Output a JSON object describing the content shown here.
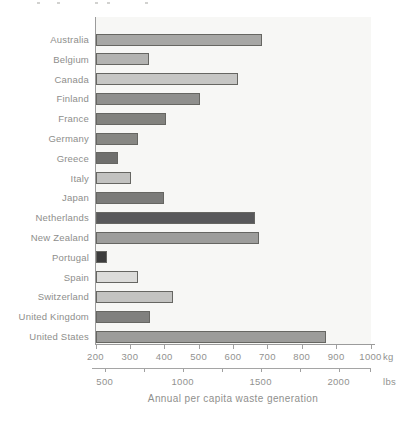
{
  "title": "Annual per capita waste generation",
  "colors": {
    "axis": "#9b9b9b",
    "tick": "#a0a0a0",
    "label_text": "#8e8e8c",
    "plot_background": "#f7f7f5",
    "bar_border": "#666662"
  },
  "units": {
    "primary": "kg",
    "secondary": "lbs"
  },
  "chart_data": {
    "type": "bar",
    "orientation": "horizontal",
    "title": "Annual per capita waste generation",
    "xlabel": "Annual per capita waste generation",
    "unit_primary": "kg",
    "unit_secondary": "lbs",
    "axis_kg": {
      "min": 200,
      "max": 1000,
      "tick_step": 100,
      "tick_labels": [
        "200",
        "300",
        "400",
        "500",
        "600",
        "700",
        "800",
        "900",
        "1000"
      ]
    },
    "axis_lbs": {
      "major_ticks": [
        500,
        1000,
        1500,
        2000
      ],
      "tick_labels": [
        "500",
        "1000",
        "1500",
        "2000"
      ],
      "minor_ticks": [
        750,
        1250,
        1750,
        2200
      ]
    },
    "categories": [
      "Australia",
      "Belgium",
      "Canada",
      "Finland",
      "France",
      "Germany",
      "Greece",
      "Italy",
      "Japan",
      "Netherlands",
      "New Zealand",
      "Portugal",
      "Spain",
      "Switzerland",
      "United Kingdom",
      "United States"
    ],
    "values_kg": [
      680,
      350,
      610,
      500,
      400,
      320,
      260,
      300,
      395,
      660,
      670,
      230,
      320,
      420,
      355,
      865
    ],
    "bar_colors": [
      "#a7a7a5",
      "#b3b3b1",
      "#c6c6c4",
      "#8f8f8d",
      "#82827e",
      "#878783",
      "#6f6f6d",
      "#c2c2c0",
      "#7b7b79",
      "#58585a",
      "#9d9d9b",
      "#3c3c3c",
      "#dcdcda",
      "#c3c3c1",
      "#80807e",
      "#9c9c9a"
    ],
    "grid": false,
    "legend": false
  }
}
